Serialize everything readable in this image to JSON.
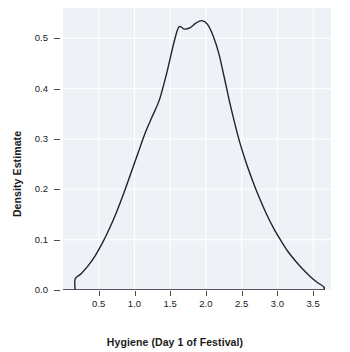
{
  "chart_data": {
    "type": "line",
    "title": "",
    "subtitle": "",
    "xlabel": "Hygiene (Day 1 of Festival)",
    "ylabel": "Density Estimate",
    "xlim": [
      0.0,
      3.75
    ],
    "ylim": [
      0.0,
      0.56
    ],
    "xticks": [
      0.5,
      1.0,
      1.5,
      2.0,
      2.5,
      3.0,
      3.5
    ],
    "xtick_labels": [
      "0.5",
      "1.0",
      "1.5",
      "2.0",
      "2.5",
      "3.0",
      "3.5"
    ],
    "yticks": [
      0.0,
      0.1,
      0.2,
      0.3,
      0.4,
      0.5
    ],
    "ytick_labels": [
      "0.0",
      "0.1",
      "0.2",
      "0.3",
      "0.4",
      "0.5"
    ],
    "grid": true,
    "legend": false,
    "legend_position": "none",
    "panel_background": "#eef2f7",
    "grid_color": "#ffffff",
    "line_color": "#1f2430",
    "line_width": 1.4,
    "series": [
      {
        "name": "Hygiene day 1 density",
        "x": [
          0.17,
          0.17,
          0.25,
          0.35,
          0.45,
          0.55,
          0.65,
          0.75,
          0.85,
          0.95,
          1.05,
          1.15,
          1.25,
          1.35,
          1.45,
          1.55,
          1.62,
          1.7,
          1.78,
          1.86,
          1.94,
          2.02,
          2.1,
          2.18,
          2.26,
          2.34,
          2.45,
          2.55,
          2.65,
          2.75,
          2.85,
          2.95,
          3.05,
          3.15,
          3.25,
          3.35,
          3.45,
          3.55,
          3.65,
          3.65
        ],
        "y": [
          0.0,
          0.022,
          0.032,
          0.048,
          0.068,
          0.093,
          0.122,
          0.155,
          0.192,
          0.232,
          0.272,
          0.312,
          0.345,
          0.378,
          0.43,
          0.49,
          0.522,
          0.518,
          0.521,
          0.53,
          0.535,
          0.528,
          0.505,
          0.47,
          0.42,
          0.368,
          0.305,
          0.258,
          0.218,
          0.182,
          0.15,
          0.122,
          0.098,
          0.076,
          0.058,
          0.042,
          0.028,
          0.016,
          0.006,
          0.0
        ]
      }
    ],
    "annotations": []
  },
  "axes": {
    "x_title": "Hygiene (Day 1 of Festival)",
    "y_title": "Density Estimate"
  }
}
